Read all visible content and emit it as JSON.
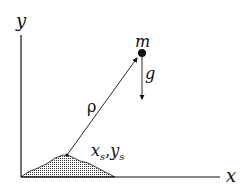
{
  "diagram": {
    "axes": {
      "x_label": "x",
      "y_label": "y"
    },
    "mass_label": "m",
    "gravity_label": "g",
    "distance_label": "ρ",
    "source_label_x": "x",
    "source_label_x_sub": "s",
    "source_label_sep": ",",
    "source_label_y": "y",
    "source_label_y_sub": "s"
  }
}
